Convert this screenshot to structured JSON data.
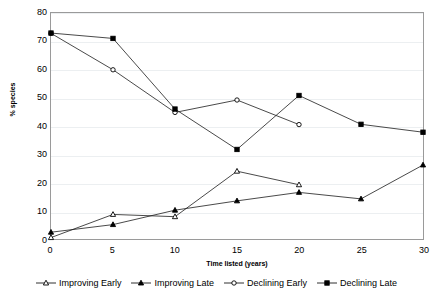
{
  "chart_data": {
    "type": "line",
    "title": "",
    "xlabel": "Time listed (years)",
    "ylabel": "% species",
    "x": [
      0,
      5,
      10,
      15,
      20,
      25,
      30
    ],
    "xlim": [
      0,
      30
    ],
    "ylim": [
      0,
      80
    ],
    "xticks": [
      "0",
      "5",
      "10",
      "15",
      "20",
      "25",
      "30"
    ],
    "yticks": [
      "0",
      "10",
      "20",
      "30",
      "40",
      "50",
      "60",
      "70",
      "80"
    ],
    "grid": true,
    "legend_position": "bottom",
    "series": [
      {
        "name": "Improving Early",
        "marker": "open-triangle",
        "x": [
          0,
          5,
          10,
          15,
          20
        ],
        "values": [
          0.5,
          8.7,
          7.9,
          24.0,
          19.2
        ]
      },
      {
        "name": "Improving Late",
        "marker": "filled-triangle",
        "x": [
          0,
          5,
          10,
          15,
          20,
          25,
          30
        ],
        "values": [
          2.4,
          5.1,
          10.2,
          13.5,
          16.5,
          14.2,
          26.2
        ]
      },
      {
        "name": "Declining Early",
        "marker": "open-circle",
        "x": [
          0,
          5,
          10,
          15,
          20
        ],
        "values": [
          72.8,
          59.9,
          44.8,
          49.2,
          40.5
        ]
      },
      {
        "name": "Declining Late",
        "marker": "filled-square",
        "x": [
          0,
          5,
          10,
          15,
          20,
          25,
          30
        ],
        "values": [
          72.9,
          71.0,
          46.0,
          31.7,
          50.8,
          40.6,
          37.8
        ]
      }
    ]
  },
  "axes": {
    "y_title": "% species",
    "x_title": "Time listed (years)"
  },
  "legend": {
    "items": [
      {
        "label": "Improving Early"
      },
      {
        "label": "Improving Late"
      },
      {
        "label": "Declining Early"
      },
      {
        "label": "Declining Late"
      }
    ]
  }
}
